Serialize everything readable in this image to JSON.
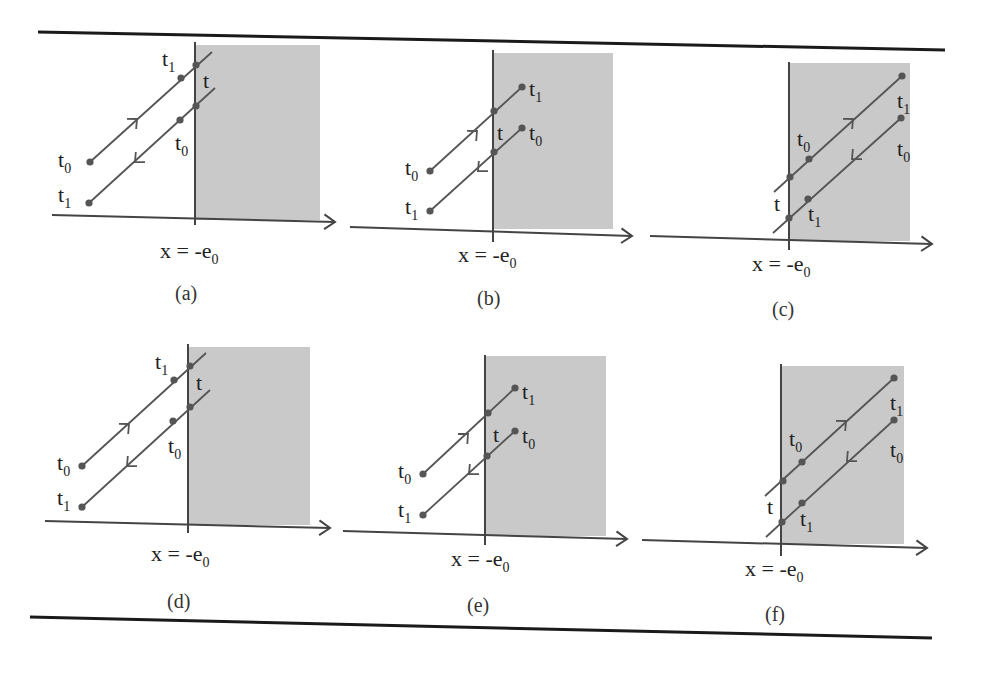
{
  "figure": {
    "rules": [
      {
        "name": "top-rule",
        "x1": 38,
        "y1": 32,
        "x2": 945,
        "y2": 50
      },
      {
        "name": "bottom-rule",
        "x1": 30,
        "y1": 617,
        "x2": 932,
        "y2": 638
      }
    ],
    "colors": {
      "shade": "#c9c9c9",
      "line": "#555555",
      "axis": "#444444",
      "dot": "#555555",
      "text": "#222222"
    },
    "boundary_label": "x = -e",
    "boundary_label_sub": "0",
    "panels": [
      {
        "id": "a",
        "caption": "(a)",
        "axis": {
          "x1": 52,
          "y1": 215,
          "x2": 335,
          "y2": 222
        },
        "vline": {
          "x": 195,
          "y1": 42,
          "y2": 225
        },
        "shade": {
          "x": 195,
          "y": 45,
          "w": 125,
          "h": 175
        },
        "lines": [
          {
            "x1": 90,
            "y1": 162,
            "x2": 212,
            "y2": 52,
            "dots": [
              [
                90,
                162
              ],
              [
                181,
                78
              ],
              [
                196,
                65
              ]
            ],
            "arrow": {
              "x": 137,
              "y": 119,
              "dir": "up"
            }
          },
          {
            "x1": 89,
            "y1": 203,
            "x2": 215,
            "y2": 88,
            "dots": [
              [
                89,
                203
              ],
              [
                180,
                120
              ],
              [
                196,
                106
              ]
            ],
            "arrow": {
              "x": 135,
              "y": 162,
              "dir": "down"
            }
          }
        ],
        "labels": [
          {
            "t": "t",
            "sub": "0",
            "x": 58,
            "y": 167
          },
          {
            "t": "t",
            "sub": "1",
            "x": 58,
            "y": 202
          },
          {
            "t": "t",
            "sub": "1",
            "x": 162,
            "y": 66
          },
          {
            "t": "t",
            "sub": "",
            "x": 203,
            "y": 88
          },
          {
            "t": "t",
            "sub": "0",
            "x": 175,
            "y": 150
          }
        ],
        "xlabel": {
          "x": 160,
          "y": 258
        },
        "captionPos": {
          "x": 175,
          "y": 300
        }
      },
      {
        "id": "b",
        "caption": "(b)",
        "axis": {
          "x1": 350,
          "y1": 227,
          "x2": 632,
          "y2": 236
        },
        "vline": {
          "x": 493,
          "y1": 50,
          "y2": 242
        },
        "shade": {
          "x": 493,
          "y": 53,
          "w": 120,
          "h": 176
        },
        "lines": [
          {
            "x1": 430,
            "y1": 171,
            "x2": 522,
            "y2": 87,
            "dots": [
              [
                430,
                171
              ],
              [
                494,
                111
              ],
              [
                522,
                87
              ]
            ],
            "arrow": {
              "x": 477,
              "y": 131,
              "dir": "up"
            }
          },
          {
            "x1": 430,
            "y1": 211,
            "x2": 522,
            "y2": 128,
            "dots": [
              [
                430,
                211
              ],
              [
                494,
                152
              ],
              [
                522,
                128
              ]
            ],
            "arrow": {
              "x": 478,
              "y": 171,
              "dir": "down"
            }
          }
        ],
        "labels": [
          {
            "t": "t",
            "sub": "0",
            "x": 405,
            "y": 175
          },
          {
            "t": "t",
            "sub": "1",
            "x": 405,
            "y": 214
          },
          {
            "t": "t",
            "sub": "1",
            "x": 529,
            "y": 96
          },
          {
            "t": "t",
            "sub": "",
            "x": 497,
            "y": 140
          },
          {
            "t": "t",
            "sub": "0",
            "x": 529,
            "y": 140
          }
        ],
        "xlabel": {
          "x": 458,
          "y": 262
        },
        "captionPos": {
          "x": 477,
          "y": 305
        }
      },
      {
        "id": "c",
        "caption": "(c)",
        "axis": {
          "x1": 650,
          "y1": 236,
          "x2": 932,
          "y2": 244
        },
        "vline": {
          "x": 789,
          "y1": 62,
          "y2": 250
        },
        "shade": {
          "x": 790,
          "y": 63,
          "w": 120,
          "h": 178
        },
        "lines": [
          {
            "x1": 774,
            "y1": 192,
            "x2": 902,
            "y2": 76,
            "dots": [
              [
                790,
                177
              ],
              [
                809,
                159
              ],
              [
                902,
                76
              ]
            ],
            "arrow": {
              "x": 853,
              "y": 119,
              "dir": "up"
            }
          },
          {
            "x1": 773,
            "y1": 233,
            "x2": 901,
            "y2": 118,
            "dots": [
              [
                789,
                218
              ],
              [
                808,
                199
              ],
              [
                901,
                118
              ]
            ],
            "arrow": {
              "x": 852,
              "y": 159,
              "dir": "down"
            }
          }
        ],
        "labels": [
          {
            "t": "t",
            "sub": "0",
            "x": 797,
            "y": 146
          },
          {
            "t": "t",
            "sub": "",
            "x": 774,
            "y": 211
          },
          {
            "t": "t",
            "sub": "1",
            "x": 808,
            "y": 221
          },
          {
            "t": "t",
            "sub": "1",
            "x": 897,
            "y": 108
          },
          {
            "t": "t",
            "sub": "0",
            "x": 897,
            "y": 156
          }
        ],
        "xlabel": {
          "x": 752,
          "y": 271
        },
        "captionPos": {
          "x": 772,
          "y": 316
        }
      },
      {
        "id": "d",
        "caption": "(d)",
        "axis": {
          "x1": 45,
          "y1": 521,
          "x2": 330,
          "y2": 528
        },
        "vline": {
          "x": 188,
          "y1": 344,
          "y2": 533
        },
        "shade": {
          "x": 189,
          "y": 347,
          "w": 121,
          "h": 178
        },
        "lines": [
          {
            "x1": 82,
            "y1": 466,
            "x2": 206,
            "y2": 353,
            "dots": [
              [
                82,
                466
              ],
              [
                174,
                380
              ],
              [
                190,
                366
              ]
            ],
            "arrow": {
              "x": 129,
              "y": 424,
              "dir": "up"
            }
          },
          {
            "x1": 82,
            "y1": 507,
            "x2": 210,
            "y2": 390,
            "dots": [
              [
                82,
                507
              ],
              [
                173,
                421
              ],
              [
                190,
                407
              ]
            ],
            "arrow": {
              "x": 127,
              "y": 466,
              "dir": "down"
            }
          }
        ],
        "labels": [
          {
            "t": "t",
            "sub": "0",
            "x": 57,
            "y": 470
          },
          {
            "t": "t",
            "sub": "1",
            "x": 57,
            "y": 505
          },
          {
            "t": "t",
            "sub": "1",
            "x": 155,
            "y": 369
          },
          {
            "t": "t",
            "sub": "",
            "x": 196,
            "y": 390
          },
          {
            "t": "t",
            "sub": "0",
            "x": 168,
            "y": 453
          }
        ],
        "xlabel": {
          "x": 151,
          "y": 561
        },
        "captionPos": {
          "x": 167,
          "y": 608
        }
      },
      {
        "id": "e",
        "caption": "(e)",
        "axis": {
          "x1": 343,
          "y1": 531,
          "x2": 627,
          "y2": 539
        },
        "vline": {
          "x": 485,
          "y1": 355,
          "y2": 545
        },
        "shade": {
          "x": 486,
          "y": 356,
          "w": 120,
          "h": 180
        },
        "lines": [
          {
            "x1": 423,
            "y1": 474,
            "x2": 515,
            "y2": 388,
            "dots": [
              [
                423,
                474
              ],
              [
                488,
                413
              ],
              [
                515,
                388
              ]
            ],
            "arrow": {
              "x": 468,
              "y": 434,
              "dir": "up"
            }
          },
          {
            "x1": 423,
            "y1": 515,
            "x2": 515,
            "y2": 431,
            "dots": [
              [
                423,
                515
              ],
              [
                487,
                456
              ],
              [
                515,
                431
              ]
            ],
            "arrow": {
              "x": 469,
              "y": 474,
              "dir": "down"
            }
          }
        ],
        "labels": [
          {
            "t": "t",
            "sub": "0",
            "x": 398,
            "y": 478
          },
          {
            "t": "t",
            "sub": "1",
            "x": 398,
            "y": 517
          },
          {
            "t": "t",
            "sub": "1",
            "x": 522,
            "y": 399
          },
          {
            "t": "t",
            "sub": "",
            "x": 493,
            "y": 442
          },
          {
            "t": "t",
            "sub": "0",
            "x": 522,
            "y": 443
          }
        ],
        "xlabel": {
          "x": 451,
          "y": 566
        },
        "captionPos": {
          "x": 467,
          "y": 612
        }
      },
      {
        "id": "f",
        "caption": "(f)",
        "axis": {
          "x1": 642,
          "y1": 540,
          "x2": 927,
          "y2": 548
        },
        "vline": {
          "x": 781,
          "y1": 364,
          "y2": 556
        },
        "shade": {
          "x": 782,
          "y": 366,
          "w": 122,
          "h": 178
        },
        "lines": [
          {
            "x1": 765,
            "y1": 496,
            "x2": 894,
            "y2": 378,
            "dots": [
              [
                783,
                481
              ],
              [
                802,
                462
              ],
              [
                894,
                378
              ]
            ],
            "arrow": {
              "x": 846,
              "y": 421,
              "dir": "up"
            }
          },
          {
            "x1": 766,
            "y1": 537,
            "x2": 894,
            "y2": 420,
            "dots": [
              [
                782,
                522
              ],
              [
                802,
                503
              ],
              [
                894,
                420
              ]
            ],
            "arrow": {
              "x": 847,
              "y": 461,
              "dir": "down"
            }
          }
        ],
        "labels": [
          {
            "t": "t",
            "sub": "0",
            "x": 789,
            "y": 446
          },
          {
            "t": "t",
            "sub": "",
            "x": 767,
            "y": 514
          },
          {
            "t": "t",
            "sub": "1",
            "x": 800,
            "y": 526
          },
          {
            "t": "t",
            "sub": "1",
            "x": 890,
            "y": 410
          },
          {
            "t": "t",
            "sub": "0",
            "x": 890,
            "y": 457
          }
        ],
        "xlabel": {
          "x": 745,
          "y": 576
        },
        "captionPos": {
          "x": 765,
          "y": 621
        }
      }
    ]
  }
}
